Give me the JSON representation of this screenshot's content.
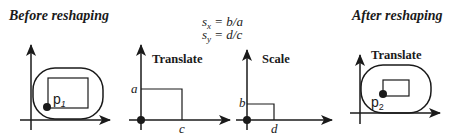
{
  "titles": {
    "before": "Before reshaping",
    "after": "After reshaping"
  },
  "equations": {
    "sx_var": "s",
    "sx_sub": "x",
    "sx_rhs": " = b/a",
    "sy_var": "s",
    "sy_sub": "y",
    "sy_rhs": " = d/c"
  },
  "panels": {
    "before": {
      "point_label": "p",
      "point_sub": "1"
    },
    "translate": {
      "label": "Translate",
      "y_mark": "a",
      "x_mark": "c"
    },
    "scale": {
      "label": "Scale",
      "y_mark": "b",
      "x_mark": "d"
    },
    "after": {
      "label": "Translate",
      "point_label": "p",
      "point_sub": "2"
    }
  },
  "colors": {
    "ink": "#1a1a1a",
    "background": "#ffffff"
  }
}
